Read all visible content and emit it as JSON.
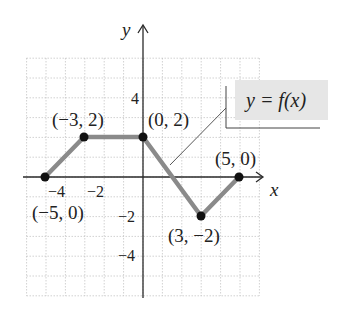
{
  "chart_data": {
    "type": "line",
    "title": "",
    "function_label": "y = f(x)",
    "xlabel": "x",
    "ylabel": "y",
    "xlim": [
      -6,
      6
    ],
    "ylim": [
      -6,
      6
    ],
    "grid": true,
    "x_tick_labels": [
      "−4",
      "−2"
    ],
    "y_tick_labels": [
      "4",
      "−2",
      "−4"
    ],
    "series": [
      {
        "name": "y = f(x)",
        "x": [
          -5,
          -3,
          0,
          3,
          5
        ],
        "y": [
          0,
          2,
          2,
          -2,
          0
        ]
      }
    ],
    "points": [
      {
        "x": -5,
        "y": 0,
        "label": "(−5, 0)"
      },
      {
        "x": -3,
        "y": 2,
        "label": "(−3, 2)"
      },
      {
        "x": 0,
        "y": 2,
        "label": "(0, 2)"
      },
      {
        "x": 3,
        "y": -2,
        "label": "(3, −2)"
      },
      {
        "x": 5,
        "y": 0,
        "label": "(5, 0)"
      }
    ],
    "colors": {
      "curve": "#8a8a8a",
      "points": "#111111",
      "label_box": "#e6e6e6"
    }
  }
}
